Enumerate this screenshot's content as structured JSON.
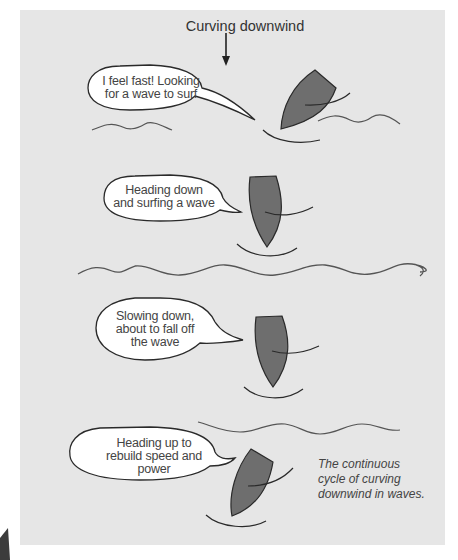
{
  "title": "Curving downwind",
  "caption": {
    "line1": "The continuous",
    "line2": "cycle of curving",
    "line3": "downwind in waves."
  },
  "stages": [
    {
      "name": "looking-for-wave",
      "bubble_lines": [
        "I feel fast! Looking",
        "for a wave to surf"
      ]
    },
    {
      "name": "surfing",
      "bubble_lines": [
        "Heading down",
        "and surfing a wave"
      ]
    },
    {
      "name": "slowing",
      "bubble_lines": [
        "Slowing down,",
        "about to fall off",
        "the wave"
      ]
    },
    {
      "name": "heading-up",
      "bubble_lines": [
        "Heading up to",
        "rebuild speed and",
        "power"
      ]
    }
  ],
  "colors": {
    "panel": "#e6e6e6",
    "boat_fill": "#6e6e6e",
    "outline": "#2a2a2a",
    "wave": "#555555",
    "bubble": "#ffffff"
  }
}
